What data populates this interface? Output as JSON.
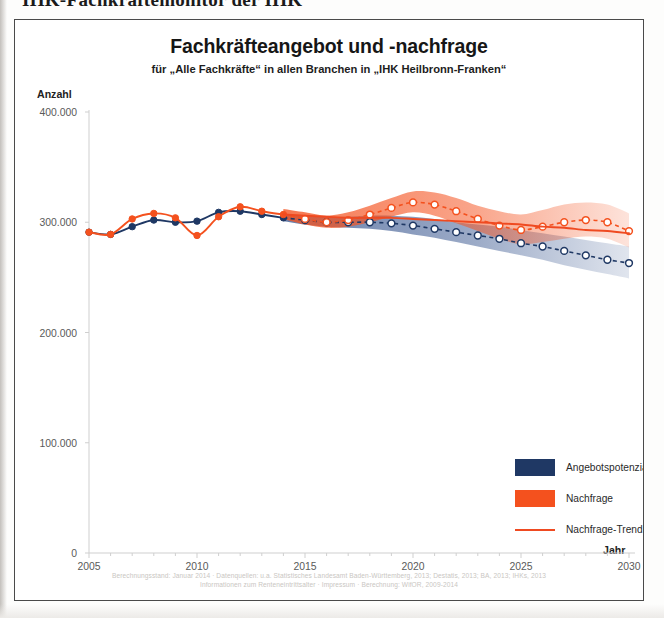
{
  "page": {
    "header_text": "IHK-Fachkräftemonitor der IHK"
  },
  "chart_card": {
    "title": "Fachkräfteangebot und -nachfrage",
    "subtitle": "für „Alle Fachkräfte“ in allen Branchen in „IHK Heilbronn-Franken“",
    "y_axis_label": "Anzahl",
    "x_axis_label": "Jahr",
    "legend": [
      {
        "label": "Angebotspotenzial",
        "color": "#1f3864",
        "marker": "swatch"
      },
      {
        "label": "Nachfrage",
        "color": "#f4511e",
        "marker": "swatch"
      },
      {
        "label": "Nachfrage-Trend",
        "color": "#ef4a21",
        "marker": "line"
      }
    ],
    "footer_line_1": "Berechnungsstand: Januar 2014 · Datenquellen: u.a. Statistisches Landesamt Baden-Württemberg, 2013; Destatis, 2013; BA, 2013; IHKs, 2013",
    "footer_line_2": "Informationen zum Renteneintrittsalter · Impressum · Berechnung: WifOR, 2009-2014"
  },
  "chart_data": {
    "type": "line",
    "title": "Fachkräfteangebot und -nachfrage",
    "subtitle": "für „Alle Fachkräfte“ in allen Branchen in „IHK Heilbronn-Franken“",
    "xlabel": "Jahr",
    "ylabel": "Anzahl",
    "xlim": [
      2005,
      2030
    ],
    "ylim": [
      0,
      400000
    ],
    "xticks": [
      2005,
      2010,
      2015,
      2020,
      2025,
      2030
    ],
    "xtick_labels": [
      "2005",
      "2010",
      "2015",
      "2020",
      "2025",
      "2030"
    ],
    "yticks": [
      0,
      100000,
      200000,
      300000,
      400000
    ],
    "ytick_labels": [
      "0",
      "100.000",
      "200.000",
      "300.000",
      "400.000"
    ],
    "grid": false,
    "legend_position": "lower right",
    "forecast_start_year": 2014,
    "x": [
      2005,
      2006,
      2007,
      2008,
      2009,
      2010,
      2011,
      2012,
      2013,
      2014,
      2015,
      2016,
      2017,
      2018,
      2019,
      2020,
      2021,
      2022,
      2023,
      2024,
      2025,
      2026,
      2027,
      2028,
      2029,
      2030
    ],
    "series": [
      {
        "name": "Angebotspotenzial",
        "color": "#1f3864",
        "values": [
          291000,
          289000,
          296000,
          302000,
          300000,
          301000,
          309000,
          310000,
          307000,
          304000,
          302000,
          300000,
          300000,
          300000,
          299000,
          297000,
          294000,
          291000,
          288000,
          285000,
          281000,
          278000,
          274000,
          270000,
          266000,
          263000
        ],
        "band_low": [
          null,
          null,
          null,
          null,
          null,
          null,
          null,
          null,
          null,
          301000,
          298000,
          296000,
          295000,
          294000,
          292000,
          289000,
          286000,
          282000,
          278000,
          274000,
          270000,
          266000,
          261000,
          257000,
          253000,
          249000
        ],
        "band_high": [
          null,
          null,
          null,
          null,
          null,
          null,
          null,
          null,
          null,
          307000,
          306000,
          305000,
          305000,
          306000,
          306000,
          305000,
          303000,
          300000,
          298000,
          296000,
          293000,
          290000,
          287000,
          284000,
          281000,
          278000
        ]
      },
      {
        "name": "Nachfrage",
        "color": "#f4511e",
        "values": [
          291000,
          289000,
          303000,
          308000,
          304000,
          288000,
          305000,
          314000,
          310000,
          307000,
          303000,
          300000,
          302000,
          307000,
          313000,
          318000,
          316000,
          310000,
          303000,
          297000,
          293000,
          296000,
          300000,
          302000,
          300000,
          292000
        ],
        "band_low": [
          null,
          null,
          null,
          null,
          null,
          null,
          null,
          null,
          null,
          303000,
          298000,
          295000,
          296000,
          300000,
          305000,
          309000,
          306000,
          299000,
          292000,
          285000,
          280000,
          282000,
          285000,
          287000,
          285000,
          277000
        ],
        "band_high": [
          null,
          null,
          null,
          null,
          null,
          null,
          null,
          null,
          null,
          312000,
          309000,
          306000,
          309000,
          315000,
          322000,
          328000,
          327000,
          322000,
          315000,
          310000,
          307000,
          311000,
          316000,
          318000,
          316000,
          308000
        ]
      },
      {
        "name": "Nachfrage-Trend",
        "color": "#ef4a21",
        "type": "trend",
        "values": [
          null,
          null,
          null,
          null,
          null,
          null,
          null,
          null,
          null,
          307000,
          306000,
          305000,
          304000,
          304000,
          304000,
          303000,
          302000,
          301000,
          300000,
          299000,
          298000,
          296000,
          295000,
          293000,
          292000,
          290000
        ]
      }
    ]
  }
}
